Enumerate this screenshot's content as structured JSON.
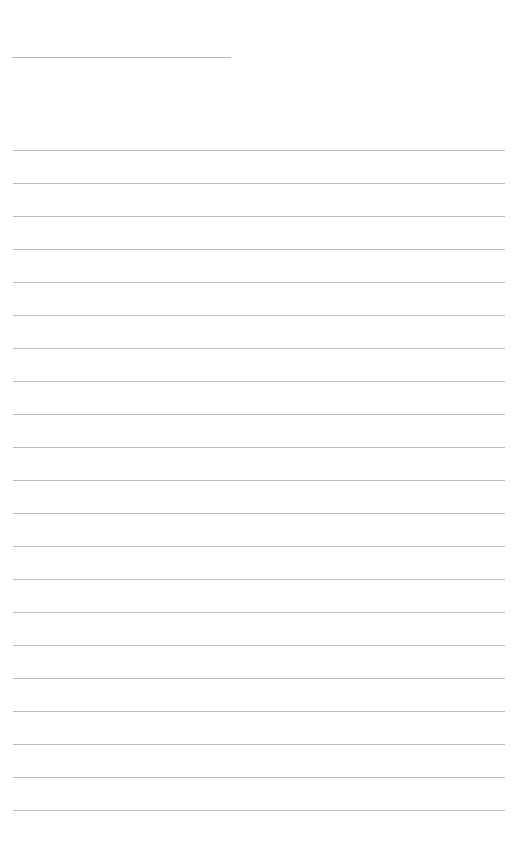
{
  "page": {
    "type": "lined-paper",
    "header_line": {
      "present": true
    },
    "ruled_lines": {
      "count": 21,
      "first_y": 150,
      "spacing": 33
    },
    "line_color": "#bdbdbd",
    "background": "#ffffff",
    "text": []
  }
}
